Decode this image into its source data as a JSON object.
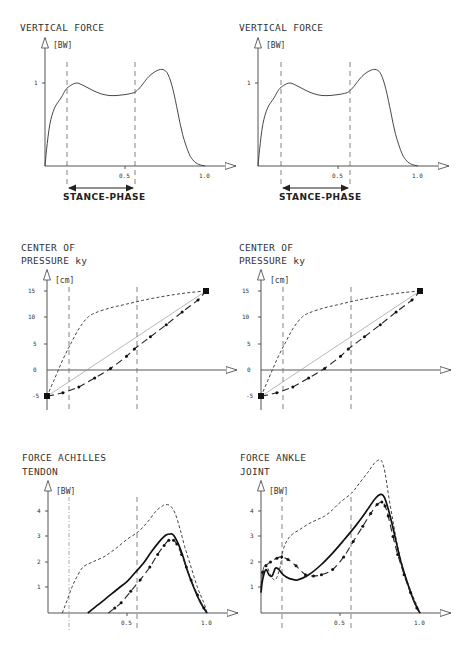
{
  "chart_data": [
    {
      "id": "vf_left",
      "type": "line",
      "title": "VERTICAL FORCE",
      "ylabel": "[BW]",
      "xlabel": "",
      "xlim": [
        0,
        1.1
      ],
      "ylim": [
        0,
        1.45
      ],
      "xticks": [
        "0.5",
        "1.0"
      ],
      "yticks": [
        "1"
      ],
      "vlines": [
        0.13,
        0.57
      ],
      "annotation": "STANCE-PHASE",
      "series": [
        {
          "name": "vertical force",
          "style": "solid",
          "x": [
            0,
            0.01,
            0.03,
            0.06,
            0.1,
            0.13,
            0.16,
            0.2,
            0.25,
            0.3,
            0.35,
            0.4,
            0.45,
            0.5,
            0.55,
            0.57,
            0.6,
            0.65,
            0.7,
            0.74,
            0.77,
            0.8,
            0.83,
            0.86,
            0.9,
            0.93,
            0.96,
            1.0
          ],
          "y": [
            0,
            0.2,
            0.5,
            0.7,
            0.82,
            0.92,
            0.97,
            1.0,
            0.96,
            0.91,
            0.87,
            0.85,
            0.85,
            0.86,
            0.88,
            0.9,
            0.96,
            1.08,
            1.15,
            1.16,
            1.1,
            0.92,
            0.65,
            0.38,
            0.15,
            0.06,
            0.02,
            0
          ]
        }
      ]
    },
    {
      "id": "vf_right",
      "type": "line",
      "title": "VERTICAL FORCE",
      "ylabel": "[BW]",
      "xlabel": "",
      "xlim": [
        0,
        1.1
      ],
      "ylim": [
        0,
        1.45
      ],
      "xticks": [
        "0.5",
        "1.0"
      ],
      "yticks": [
        "1"
      ],
      "vlines": [
        0.13,
        0.57
      ],
      "annotation": "STANCE-PHASE",
      "series": [
        {
          "name": "vertical force",
          "style": "solid",
          "x": [
            0,
            0.01,
            0.03,
            0.06,
            0.1,
            0.13,
            0.16,
            0.2,
            0.25,
            0.3,
            0.35,
            0.4,
            0.45,
            0.5,
            0.55,
            0.57,
            0.6,
            0.65,
            0.7,
            0.74,
            0.77,
            0.8,
            0.83,
            0.86,
            0.9,
            0.93,
            0.96,
            1.0
          ],
          "y": [
            0,
            0.2,
            0.5,
            0.7,
            0.82,
            0.92,
            0.97,
            1.0,
            0.96,
            0.91,
            0.87,
            0.85,
            0.85,
            0.86,
            0.88,
            0.9,
            0.96,
            1.08,
            1.15,
            1.16,
            1.1,
            0.92,
            0.65,
            0.38,
            0.15,
            0.06,
            0.02,
            0
          ]
        }
      ]
    },
    {
      "id": "cop_left",
      "type": "line",
      "title": "CENTER OF",
      "title2": "PRESSURE  ky",
      "ylabel": "[cm]",
      "xlabel": "",
      "xlim": [
        0,
        1.1
      ],
      "ylim": [
        -6,
        17
      ],
      "yticks": [
        "15",
        "10",
        "5",
        "0",
        "-5"
      ],
      "ytick_values": [
        15,
        10,
        5,
        0,
        -5
      ],
      "vlines": [
        0.13,
        0.57
      ],
      "series": [
        {
          "name": "dashed curve",
          "style": "dashed",
          "x": [
            0,
            0.05,
            0.1,
            0.15,
            0.2,
            0.25,
            0.3,
            0.4,
            0.5,
            0.6,
            0.7,
            0.8,
            0.9,
            1.0
          ],
          "y": [
            -5,
            -1.5,
            2,
            5,
            7.8,
            9.8,
            10.8,
            11.8,
            12.5,
            13.2,
            13.8,
            14.3,
            14.7,
            15
          ]
        },
        {
          "name": "straight line",
          "style": "thin",
          "x": [
            0,
            1.0
          ],
          "y": [
            -5,
            15
          ]
        },
        {
          "name": "dash-dot curve",
          "style": "dashdot",
          "x": [
            0,
            0.1,
            0.2,
            0.3,
            0.4,
            0.5,
            0.55,
            0.65,
            0.75,
            0.85,
            0.95,
            1.0
          ],
          "y": [
            -5,
            -4.3,
            -3.2,
            -1.5,
            0.3,
            2.6,
            4,
            6.3,
            8.6,
            11,
            13.3,
            15
          ]
        }
      ]
    },
    {
      "id": "cop_right",
      "type": "line",
      "title": "CENTER OF",
      "title2": "PRESSURE  ky",
      "ylabel": "[cm]",
      "xlabel": "",
      "xlim": [
        0,
        1.1
      ],
      "ylim": [
        -6,
        17
      ],
      "yticks": [
        "15",
        "10",
        "5",
        "0",
        "-5"
      ],
      "ytick_values": [
        15,
        10,
        5,
        0,
        -5
      ],
      "vlines": [
        0.13,
        0.57
      ],
      "series": [
        {
          "name": "dashed curve",
          "style": "dashed",
          "x": [
            0,
            0.05,
            0.1,
            0.15,
            0.2,
            0.25,
            0.3,
            0.4,
            0.5,
            0.6,
            0.7,
            0.8,
            0.9,
            1.0
          ],
          "y": [
            -5,
            -1.5,
            2,
            5,
            7.8,
            9.8,
            10.8,
            11.8,
            12.5,
            13.2,
            13.8,
            14.3,
            14.7,
            15
          ]
        },
        {
          "name": "straight line",
          "style": "thin",
          "x": [
            0,
            1.0
          ],
          "y": [
            -5,
            15
          ]
        },
        {
          "name": "dash-dot curve",
          "style": "dashdot",
          "x": [
            0,
            0.1,
            0.2,
            0.3,
            0.4,
            0.5,
            0.55,
            0.65,
            0.75,
            0.85,
            0.95,
            1.0
          ],
          "y": [
            -5,
            -4.3,
            -3.2,
            -1.5,
            0.3,
            2.6,
            4,
            6.3,
            8.6,
            11,
            13.3,
            15
          ]
        }
      ]
    },
    {
      "id": "achilles",
      "type": "line",
      "title": "FORCE ACHILLES",
      "title2": "TENDON",
      "ylabel": "[BW]",
      "xlabel": "",
      "xlim": [
        0,
        1.1
      ],
      "ylim": [
        0,
        5
      ],
      "xticks": [
        "0.5",
        "1.0"
      ],
      "yticks": [
        "1",
        "2",
        "3",
        "4"
      ],
      "ytick_values": [
        1,
        2,
        3,
        4
      ],
      "vlines": [
        0.13,
        0.57
      ],
      "series": [
        {
          "name": "dashed curve",
          "style": "dashed",
          "x": [
            0.09,
            0.12,
            0.15,
            0.18,
            0.22,
            0.28,
            0.35,
            0.42,
            0.5,
            0.57,
            0.63,
            0.68,
            0.72,
            0.74,
            0.77,
            0.8,
            0.83,
            0.86,
            0.9,
            0.94,
            0.98,
            1.0
          ],
          "y": [
            0,
            0.5,
            1.0,
            1.4,
            1.8,
            2.0,
            2.2,
            2.5,
            2.9,
            3.2,
            3.6,
            4.0,
            4.2,
            4.25,
            4.2,
            3.9,
            3.3,
            2.6,
            1.8,
            1.0,
            0.4,
            0
          ]
        },
        {
          "name": "solid curve",
          "style": "bold",
          "x": [
            0.25,
            0.3,
            0.35,
            0.4,
            0.45,
            0.5,
            0.55,
            0.6,
            0.65,
            0.7,
            0.74,
            0.77,
            0.79,
            0.82,
            0.85,
            0.88,
            0.92,
            0.96,
            1.0
          ],
          "y": [
            0,
            0.25,
            0.5,
            0.75,
            1.0,
            1.25,
            1.6,
            1.95,
            2.4,
            2.8,
            3.05,
            3.1,
            3.05,
            2.7,
            2.2,
            1.6,
            0.95,
            0.4,
            0
          ]
        },
        {
          "name": "dash-dot curve",
          "style": "dashdot",
          "x": [
            0.38,
            0.42,
            0.46,
            0.52,
            0.58,
            0.64,
            0.69,
            0.73,
            0.76,
            0.79,
            0.81,
            0.84,
            0.87,
            0.9,
            0.94,
            0.98,
            1.0
          ],
          "y": [
            0,
            0.2,
            0.4,
            0.85,
            1.3,
            1.8,
            2.3,
            2.65,
            2.85,
            2.85,
            2.7,
            2.3,
            1.8,
            1.3,
            0.7,
            0.2,
            0
          ]
        }
      ]
    },
    {
      "id": "ankle",
      "type": "line",
      "title": "FORCE ANKLE",
      "title2": "JOINT",
      "ylabel": "[BW]",
      "xlabel": "",
      "xlim": [
        0,
        1.1
      ],
      "ylim": [
        0,
        5
      ],
      "xticks": [
        "0.5",
        "1.0"
      ],
      "yticks": [
        "1",
        "2",
        "3",
        "4"
      ],
      "ytick_values": [
        1,
        2,
        3,
        4
      ],
      "vlines": [
        0.13,
        0.57
      ],
      "series": [
        {
          "name": "dashed curve",
          "style": "dashed",
          "x": [
            0,
            0.01,
            0.03,
            0.06,
            0.09,
            0.12,
            0.14,
            0.17,
            0.2,
            0.25,
            0.3,
            0.35,
            0.4,
            0.45,
            0.5,
            0.57,
            0.62,
            0.67,
            0.71,
            0.74,
            0.76,
            0.78,
            0.8,
            0.83,
            0.86,
            0.9,
            0.94,
            0.98,
            1.0
          ],
          "y": [
            0.9,
            1.6,
            1.9,
            1.5,
            1.3,
            1.8,
            2.5,
            2.9,
            3.1,
            3.3,
            3.5,
            3.65,
            3.8,
            4.05,
            4.35,
            4.7,
            5.1,
            5.5,
            5.85,
            6.0,
            5.95,
            5.5,
            4.7,
            3.6,
            2.6,
            1.6,
            0.9,
            0.3,
            0
          ]
        },
        {
          "name": "solid curve",
          "style": "bold",
          "x": [
            0,
            0.01,
            0.03,
            0.05,
            0.07,
            0.09,
            0.11,
            0.14,
            0.18,
            0.23,
            0.3,
            0.38,
            0.45,
            0.52,
            0.58,
            0.63,
            0.68,
            0.72,
            0.75,
            0.77,
            0.79,
            0.82,
            0.85,
            0.88,
            0.92,
            0.96,
            1.0
          ],
          "y": [
            0.8,
            1.3,
            1.7,
            1.5,
            1.45,
            1.75,
            1.72,
            1.5,
            1.35,
            1.3,
            1.5,
            1.9,
            2.35,
            2.85,
            3.3,
            3.7,
            4.15,
            4.5,
            4.65,
            4.6,
            4.3,
            3.6,
            2.8,
            2.0,
            1.2,
            0.5,
            0
          ]
        },
        {
          "name": "dash-dot curve",
          "style": "dashdot",
          "x": [
            0,
            0.01,
            0.03,
            0.06,
            0.1,
            0.13,
            0.17,
            0.22,
            0.28,
            0.33,
            0.38,
            0.45,
            0.52,
            0.58,
            0.64,
            0.69,
            0.73,
            0.76,
            0.78,
            0.8,
            0.83,
            0.86,
            0.9,
            0.94,
            0.98,
            1.0
          ],
          "y": [
            1.0,
            1.6,
            1.85,
            2.0,
            2.15,
            2.2,
            2.1,
            1.85,
            1.5,
            1.45,
            1.5,
            1.7,
            2.2,
            2.8,
            3.4,
            3.9,
            4.25,
            4.35,
            4.2,
            3.8,
            3.0,
            2.3,
            1.5,
            0.8,
            0.2,
            0
          ]
        }
      ]
    }
  ],
  "panels": {
    "vf_left": {
      "title": "VERTICAL FORCE",
      "unit": "[BW]",
      "y1": "1",
      "x05": "0.5",
      "x10": "1.0",
      "stance": "STANCE-PHASE"
    },
    "vf_right": {
      "title": "VERTICAL FORCE",
      "unit": "[BW]",
      "y1": "1",
      "x05": "0.5",
      "x10": "1.0",
      "stance": "STANCE-PHASE"
    },
    "cop_left": {
      "title1": "CENTER OF",
      "title2": "PRESSURE  ky",
      "unit": "[cm]",
      "y15": "15",
      "y10": "10",
      "y5": "5",
      "y0": "0",
      "ym5": "-5"
    },
    "cop_right": {
      "title1": "CENTER OF",
      "title2": "PRESSURE  ky",
      "unit": "[cm]",
      "y15": "15",
      "y10": "10",
      "y5": "5",
      "y0": "0",
      "ym5": "-5"
    },
    "achilles": {
      "title1": "FORCE ACHILLES",
      "title2": "TENDON",
      "unit": "[BW]",
      "y1": "1",
      "y2": "2",
      "y3": "3",
      "y4": "4",
      "x05": "0.5",
      "x10": "1.0"
    },
    "ankle": {
      "title1": "FORCE ANKLE",
      "title2": "JOINT",
      "unit": "[BW]",
      "y1": "1",
      "y2": "2",
      "y3": "3",
      "y4": "4",
      "x05": "0.5",
      "x10": "1.0"
    }
  }
}
